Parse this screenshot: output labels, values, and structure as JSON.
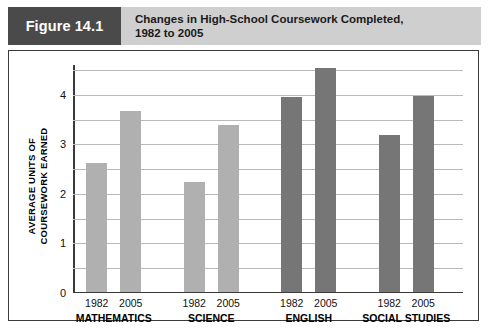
{
  "figure": {
    "tag": "Figure 14.1",
    "title_line1": "Changes in High-School Coursework Completed,",
    "title_line2": "1982 to 2005"
  },
  "colors": {
    "tag_background": "#4a4a4a",
    "header_background": "#cfcfcf",
    "frame_border": "#3a3a3a",
    "bar_light": "#b0b0b0",
    "bar_dark": "#767676",
    "gridline": "#b9b9b9"
  },
  "chart_data": {
    "type": "bar",
    "title": "Changes in High-School Coursework Completed, 1982 to 2005",
    "xlabel": "",
    "ylabel_line1": "AVERAGE UNITS OF",
    "ylabel_line2": "COURSEWORK EARNED",
    "categories": [
      "MATHEMATICS",
      "SCIENCE",
      "ENGLISH",
      "SOCIAL STUDIES"
    ],
    "series": [
      {
        "name": "1982",
        "values": [
          2.6,
          2.2,
          3.92,
          3.15
        ]
      },
      {
        "name": "2005",
        "values": [
          3.65,
          3.35,
          4.5,
          3.95
        ]
      }
    ],
    "bar_colors": [
      "#b0b0b0",
      "#b0b0b0",
      "#767676",
      "#767676"
    ],
    "ylim": [
      0,
      4.6
    ],
    "yticks": [
      0,
      1,
      2,
      3,
      4
    ],
    "ytick_labels": [
      "0",
      "1",
      "2",
      "3",
      "4"
    ],
    "gridlines": [
      0.5,
      1,
      1.5,
      2,
      2.5,
      3,
      3.5,
      4,
      4.5
    ],
    "grid": true,
    "legend": "none"
  }
}
